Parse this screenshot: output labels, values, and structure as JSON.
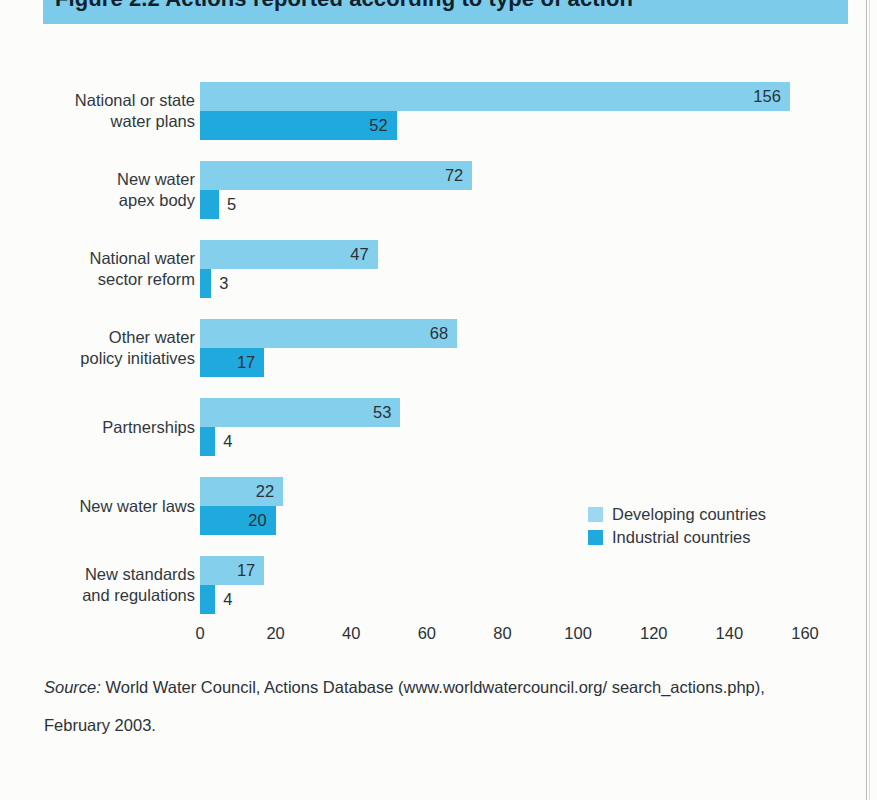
{
  "page": {
    "title_banner_text": "Figure 2.2  Actions reported according to type of action",
    "banner_color": "#7ccbea"
  },
  "legend": {
    "position": "middle-right",
    "items": [
      {
        "label": "Developing countries",
        "color": "#9ed8f0",
        "swatch_name": "legend-swatch-developing"
      },
      {
        "label": "Industrial countries",
        "color": "#1fa9dd",
        "swatch_name": "legend-swatch-industrial"
      }
    ]
  },
  "source_note": {
    "prefix": "Source:",
    "text": " World Water Council, Actions Database (www.worldwatercouncil.org/ search_actions.php), February 2003."
  },
  "chart_data": {
    "type": "bar",
    "orientation": "horizontal",
    "title": "Figure 2.2  Actions reported according to type of action",
    "xlabel": "",
    "ylabel": "",
    "xlim": [
      0,
      160
    ],
    "xticks": [
      0,
      20,
      40,
      60,
      80,
      100,
      120,
      140,
      160
    ],
    "xtick_labels": [
      "0",
      "20",
      "40",
      "60",
      "80",
      "100",
      "120",
      "140",
      "160"
    ],
    "grid": false,
    "legend_position": "middle-right",
    "categories": [
      "National or state water plans",
      "New water apex body",
      "National water sector reform",
      "Other water policy initiatives",
      "Partnerships",
      "New water laws",
      "New standards and regulations"
    ],
    "category_lines": [
      [
        "National or state",
        "water plans"
      ],
      [
        "New water",
        "apex body"
      ],
      [
        "National water",
        "sector reform"
      ],
      [
        "Other water",
        "policy initiatives"
      ],
      [
        "Partnerships"
      ],
      [
        "New water laws"
      ],
      [
        "New standards",
        "and regulations"
      ]
    ],
    "series": [
      {
        "name": "Developing countries",
        "color": "#83cfec",
        "values": [
          156,
          72,
          47,
          68,
          53,
          22,
          17
        ]
      },
      {
        "name": "Industrial countries",
        "color": "#1fa9dd",
        "values": [
          52,
          5,
          3,
          17,
          4,
          20,
          4
        ]
      }
    ]
  }
}
